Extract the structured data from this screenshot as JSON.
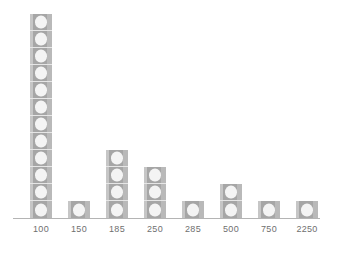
{
  "chart_data": {
    "type": "bar",
    "title": "",
    "subtitle": "",
    "xlabel": "",
    "ylabel": "",
    "categories": [
      "100",
      "150",
      "185",
      "250",
      "285",
      "500",
      "750",
      "2250"
    ],
    "values": [
      12,
      1,
      4,
      3,
      1,
      2,
      1,
      1
    ],
    "unit_symbol": "ball-icon",
    "unit_value": 1,
    "ylim": [
      0,
      12
    ],
    "grid": false,
    "legend": "none",
    "series": [
      {
        "name": "count",
        "values": [
          12,
          1,
          4,
          3,
          1,
          2,
          1,
          1
        ]
      }
    ],
    "annotations": [],
    "style": {
      "pictogram": true,
      "tile_fill": "#a6a6a6",
      "tile_highlight": "#c6c6c6",
      "tile_shadow": "#b9b9b9",
      "tile_divider": "#e6e6e6",
      "icon_fill": "#f4f4f4",
      "axis_color": "#b4b4b4",
      "label_color": "#6f6f6f",
      "background": "#ffffff"
    }
  },
  "axis": {
    "x_tick_labels": [
      "100",
      "150",
      "185",
      "250",
      "285",
      "500",
      "750",
      "2250"
    ]
  }
}
